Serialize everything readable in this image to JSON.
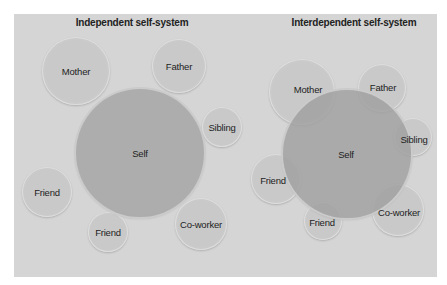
{
  "diagrams": [
    {
      "title": "Independent self-system",
      "title_x": 132,
      "self": {
        "label": "Self",
        "cx": 140,
        "cy": 153,
        "r": 64
      },
      "others": [
        {
          "label": "Mother",
          "cx": 76,
          "cy": 71,
          "r": 34
        },
        {
          "label": "Father",
          "cx": 179,
          "cy": 66,
          "r": 27
        },
        {
          "label": "Sibling",
          "cx": 222,
          "cy": 127,
          "r": 20
        },
        {
          "label": "Friend",
          "cx": 47,
          "cy": 192,
          "r": 25
        },
        {
          "label": "Friend",
          "cx": 108,
          "cy": 232,
          "r": 20
        },
        {
          "label": "Co-worker",
          "cx": 201,
          "cy": 224,
          "r": 26
        }
      ]
    },
    {
      "title": "Interdependent self-system",
      "title_x": 354,
      "self": {
        "label": "Self",
        "cx": 347,
        "cy": 154,
        "r": 64
      },
      "others": [
        {
          "label": "Mother",
          "cx": 302,
          "cy": 92,
          "r": 33
        },
        {
          "label": "Father",
          "cx": 382,
          "cy": 88,
          "r": 24
        },
        {
          "label": "Sibling",
          "cx": 413,
          "cy": 137,
          "r": 19
        },
        {
          "label": "Friend",
          "cx": 276,
          "cy": 179,
          "r": 25
        },
        {
          "label": "Friend",
          "cx": 323,
          "cy": 221,
          "r": 19
        },
        {
          "label": "Co-worker",
          "cx": 398,
          "cy": 210,
          "r": 26
        }
      ]
    }
  ],
  "colors": {
    "panel_bg": "#d5d5d5",
    "self_fill": "#aaaaaa",
    "other_fill": "#c9c9c9",
    "text": "#1d1d1d"
  }
}
